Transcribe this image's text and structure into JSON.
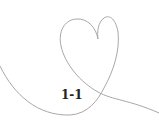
{
  "illustration": {
    "name": "heart-line-drawing",
    "stroke_color": "#a8a8a8",
    "label": "1-1",
    "label_color": "#222222"
  }
}
